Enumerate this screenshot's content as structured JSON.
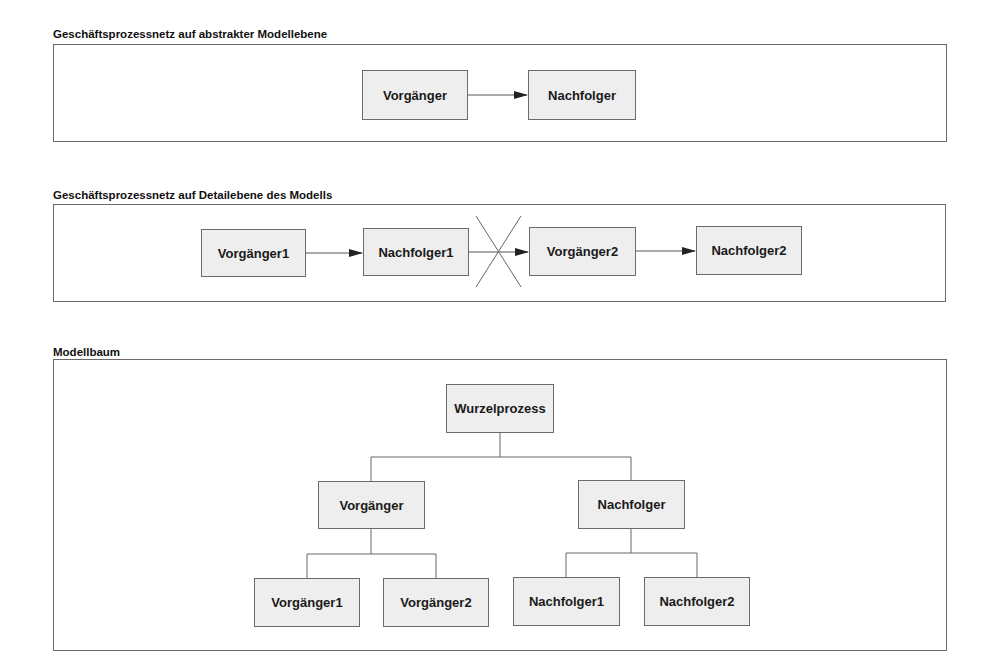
{
  "sections": [
    {
      "title": "Geschäftsprozessnetz auf abstrakter Modellebene",
      "nodes": [
        "Vorgänger",
        "Nachfolger"
      ]
    },
    {
      "title": "Geschäftsprozessnetz auf Detailebene des Modells",
      "nodes": [
        "Vorgänger1",
        "Nachfolger1",
        "Vorgänger2",
        "Nachfolger2"
      ],
      "crossed_link": "Nachfolger1 → Vorgänger2"
    },
    {
      "title": "Modellbaum",
      "root": "Wurzelprozess",
      "level1": [
        "Vorgänger",
        "Nachfolger"
      ],
      "level2_left": [
        "Vorgänger1",
        "Vorgänger2"
      ],
      "level2_right": [
        "Nachfolger1",
        "Nachfolger2"
      ]
    }
  ],
  "colors": {
    "node_fill": "#eeeeee",
    "node_border": "#6b6b6b",
    "line": "#555555"
  }
}
